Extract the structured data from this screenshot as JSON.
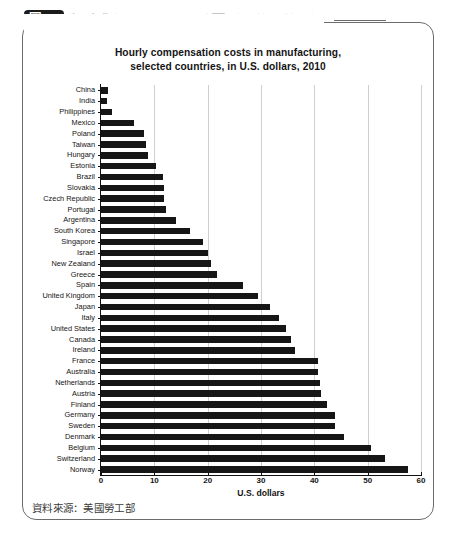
{
  "caption": {
    "figure_badge": "圖46",
    "title": "製造業每小時成本比較圖（單位：美元）"
  },
  "source_note": "資料來源：美國勞工部",
  "chart_data": {
    "type": "bar",
    "orientation": "horizontal",
    "title": "Hourly compensation costs in manufacturing,\nselected countries, in U.S. dollars, 2010",
    "title_line1": "Hourly compensation costs in manufacturing,",
    "title_line2": "selected countries, in U.S. dollars, 2010",
    "xlabel": "U.S. dollars",
    "ylabel": "",
    "xlim": [
      0,
      60
    ],
    "xticks": [
      0,
      10,
      20,
      30,
      40,
      50,
      60
    ],
    "grid": "vertical",
    "legend": "none",
    "bar_color": "#161616",
    "categories": [
      "China",
      "India",
      "Philippines",
      "Mexico",
      "Poland",
      "Taiwan",
      "Hungary",
      "Estonia",
      "Brazil",
      "Slovakia",
      "Czech Republic",
      "Portugal",
      "Argentina",
      "South Korea",
      "Singapore",
      "Israel",
      "New Zealand",
      "Greece",
      "Spain",
      "United Kingdom",
      "Japan",
      "Italy",
      "United States",
      "Canada",
      "Ireland",
      "France",
      "Australia",
      "Netherlands",
      "Austria",
      "Finland",
      "Germany",
      "Sweden",
      "Denmark",
      "Belgium",
      "Switzerland",
      "Norway"
    ],
    "values": [
      1.4,
      1.2,
      2.0,
      6.2,
      8.0,
      8.4,
      8.9,
      10.4,
      11.6,
      11.8,
      11.9,
      12.1,
      14.1,
      16.6,
      19.1,
      20.1,
      20.6,
      21.8,
      26.6,
      29.4,
      31.7,
      33.4,
      34.7,
      35.7,
      36.3,
      40.6,
      40.6,
      41.0,
      41.2,
      42.3,
      43.8,
      43.8,
      45.5,
      50.7,
      53.2,
      57.5
    ]
  }
}
